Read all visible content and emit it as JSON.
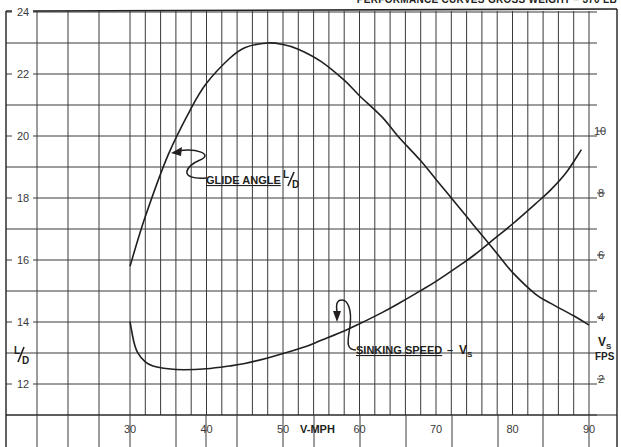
{
  "header": {
    "title": "PERFORMANCE CURVES GROSS WEIGHT – 370 LB"
  },
  "labels": {
    "glide_angle": "GLIDE ANGLE",
    "glide_unit_L": "L",
    "glide_unit_D": "D",
    "sinking_speed": "SINKING SPEED",
    "sinking_dash": "–",
    "sinking_unit_V": "V",
    "sinking_unit_S": "S",
    "left_axis_L": "L",
    "left_axis_D": "D",
    "right_axis_V": "V",
    "right_axis_S": "S",
    "right_axis_fps": "FPS",
    "x_axis": "V-MPH"
  },
  "colors": {
    "grid": "#3a3a3a",
    "curve": "#231f20",
    "background": "#ffffff"
  },
  "chart_data": {
    "type": "line",
    "title": "PERFORMANCE CURVES GROSS WEIGHT – 370 LB",
    "xlabel": "V-MPH",
    "ylabel": "L/D",
    "y2label": "Vs FPS",
    "xlim": [
      30,
      90
    ],
    "ylim": [
      12,
      24
    ],
    "y2lim": [
      2,
      10
    ],
    "x_ticks": [
      30,
      40,
      50,
      60,
      70,
      80,
      90
    ],
    "y_ticks": [
      12,
      14,
      16,
      18,
      20,
      22,
      24
    ],
    "y2_ticks": [
      2,
      4,
      6,
      8,
      10
    ],
    "grid": true,
    "series": [
      {
        "name": "GLIDE ANGLE L/D",
        "axis": "left",
        "x": [
          30,
          32,
          35,
          38,
          40,
          43,
          45,
          48,
          50,
          52,
          55,
          58,
          60,
          63,
          65,
          68,
          70,
          73,
          75,
          78,
          80,
          83,
          85,
          88,
          90
        ],
        "values": [
          15.8,
          17.4,
          19.4,
          20.9,
          21.7,
          22.5,
          22.85,
          23.0,
          22.95,
          22.8,
          22.4,
          21.8,
          21.3,
          20.6,
          20.0,
          19.2,
          18.6,
          17.7,
          17.1,
          16.2,
          15.6,
          14.9,
          14.6,
          14.2,
          13.9
        ]
      },
      {
        "name": "SINKING SPEED Vs",
        "axis": "right",
        "x": [
          30,
          30.5,
          31,
          32,
          33,
          35,
          37,
          40,
          43,
          45,
          48,
          50,
          53,
          55,
          58,
          60,
          63,
          65,
          68,
          70,
          73,
          75,
          78,
          80,
          83,
          85,
          87,
          89
        ],
        "values": [
          3.85,
          3.2,
          2.85,
          2.55,
          2.42,
          2.33,
          2.3,
          2.33,
          2.42,
          2.5,
          2.68,
          2.82,
          3.05,
          3.25,
          3.55,
          3.78,
          4.15,
          4.42,
          4.85,
          5.15,
          5.65,
          6.0,
          6.6,
          7.0,
          7.65,
          8.1,
          8.65,
          9.4
        ]
      }
    ]
  }
}
